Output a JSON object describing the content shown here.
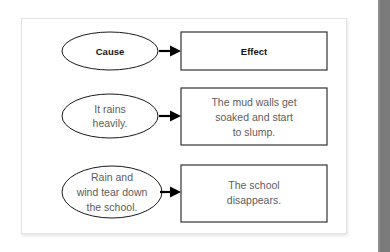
{
  "page": {
    "background_color": "#ffffff",
    "right_edge_bar_color": "#7b7b7b"
  },
  "card": {
    "background_color": "#ffffff",
    "border_color": "#e3e3e3"
  },
  "diagram": {
    "type": "cause-and-effect-flow",
    "header_text_color": "#141414",
    "body_text_color": "#5d5d5d",
    "shape_stroke_color": "#1a1a1a",
    "arrow_color": "#000000",
    "rows": [
      {
        "id": "header",
        "cause_lines": [
          "Cause"
        ],
        "effect_lines": [
          "Effect"
        ],
        "emphasis": "bold"
      },
      {
        "id": "row-1",
        "cause_lines": [
          "It rains",
          "heavily."
        ],
        "effect_lines": [
          "The mud walls get",
          "soaked and start",
          "to slump."
        ],
        "emphasis": "normal"
      },
      {
        "id": "row-2",
        "cause_lines": [
          "Rain and",
          "wind tear down",
          "the school."
        ],
        "effect_lines": [
          "The school",
          "disappears."
        ],
        "emphasis": "normal"
      }
    ]
  }
}
